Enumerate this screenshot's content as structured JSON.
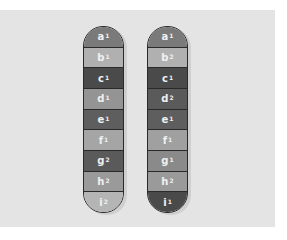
{
  "chromosomes": [
    {
      "segments": [
        {
          "gene": "a",
          "allele": "1",
          "color": "#7a7a7a"
        },
        {
          "gene": "b",
          "allele": "1",
          "color": "#b0b0b0"
        },
        {
          "gene": "c",
          "allele": "1",
          "color": "#4a4a4a"
        },
        {
          "gene": "d",
          "allele": "1",
          "color": "#949494"
        },
        {
          "gene": "e",
          "allele": "1",
          "color": "#5e5e5e"
        },
        {
          "gene": "f",
          "allele": "1",
          "color": "#a5a5a5"
        },
        {
          "gene": "g",
          "allele": "2",
          "color": "#5a5a5a"
        },
        {
          "gene": "h",
          "allele": "2",
          "color": "#9a9a9a"
        },
        {
          "gene": "i",
          "allele": "2",
          "color": "#b5b5b5"
        }
      ]
    },
    {
      "segments": [
        {
          "gene": "a",
          "allele": "1",
          "color": "#7a7a7a"
        },
        {
          "gene": "b",
          "allele": "2",
          "color": "#b0b0b0"
        },
        {
          "gene": "c",
          "allele": "1",
          "color": "#4a4a4a"
        },
        {
          "gene": "d",
          "allele": "2",
          "color": "#5a5a5a"
        },
        {
          "gene": "e",
          "allele": "1",
          "color": "#5e5e5e"
        },
        {
          "gene": "f",
          "allele": "1",
          "color": "#a0a0a0"
        },
        {
          "gene": "g",
          "allele": "1",
          "color": "#8a8a8a"
        },
        {
          "gene": "h",
          "allele": "2",
          "color": "#9a9a9a"
        },
        {
          "gene": "i",
          "allele": "1",
          "color": "#4a4a4a"
        }
      ]
    }
  ]
}
